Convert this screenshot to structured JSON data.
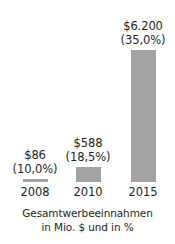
{
  "chart_data": {
    "type": "bar",
    "title": "",
    "subtitle": "",
    "xlabel": "",
    "ylabel": "",
    "categories": [
      "2008",
      "2010",
      "2015"
    ],
    "values": [
      86,
      588,
      6200
    ],
    "value_labels": [
      "$86",
      "$588",
      "$6.200"
    ],
    "percent_labels": [
      "(10,0%)",
      "(18,5%)",
      "(35,0%)"
    ],
    "percent_values": [
      10.0,
      18.5,
      35.0
    ],
    "series": [
      {
        "name": "Gesamtwerbeeinnahmen",
        "values": [
          86,
          588,
          6200
        ]
      }
    ],
    "ylim": [
      0,
      6200
    ],
    "grid": false,
    "legend": "none",
    "caption_line1": "Gesamtwerbeeinnahmen",
    "caption_line2": "in Mio. $ und in %",
    "bar_color": "#a3a3a3",
    "text_color": "#231f20",
    "background_color": "#ffffff",
    "bar_pixel_heights": [
      "3px",
      "15px",
      "132px"
    ]
  },
  "caption": {
    "line1": "Gesamtwerbeeinnahmen",
    "line2": "in Mio. $ und in %"
  }
}
